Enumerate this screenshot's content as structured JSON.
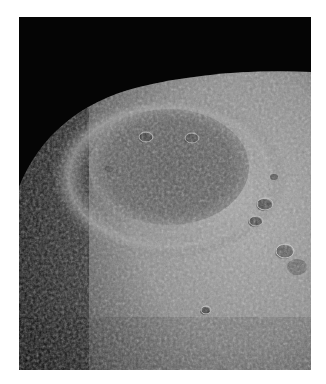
{
  "image": {
    "subject": "Lunar surface with large impact basin (Mare Orientale-like) seen obliquely",
    "alt": "Close-up view of the Moon's cratered surface with a large dark basin near center",
    "colors": {
      "background": "#ffffff",
      "space": "#050505",
      "surface_light": "#9a9a9a",
      "surface_mid": "#6e6e6e",
      "basin_dark": "#4a4a4a"
    }
  }
}
